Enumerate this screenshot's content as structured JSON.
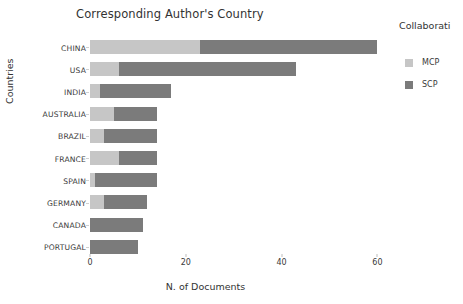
{
  "chart_data": {
    "type": "bar",
    "subtype": "horizontal-stacked-bar",
    "title": "Corresponding Author's Country",
    "xlabel": "N. of Documents",
    "ylabel": "Countries",
    "xlim": [
      0,
      62
    ],
    "xticks": [
      0,
      20,
      40,
      60
    ],
    "xtick_labels": [
      "0",
      "20",
      "40",
      "60"
    ],
    "grid": false,
    "legend_position": "right",
    "legend_title": "Collaborati",
    "categories": [
      "CHINA",
      "USA",
      "INDIA",
      "AUSTRALIA",
      "BRAZIL",
      "FRANCE",
      "SPAIN",
      "GERMANY",
      "CANADA",
      "PORTUGAL"
    ],
    "series": [
      {
        "name": "MCP",
        "color": "#c6c6c6",
        "values": [
          23,
          6,
          2,
          5,
          3,
          6,
          1,
          3,
          0,
          0
        ]
      },
      {
        "name": "SCP",
        "color": "#7b7b7b",
        "values": [
          37,
          37,
          15,
          9,
          11,
          8,
          13,
          9,
          11,
          10
        ]
      }
    ],
    "totals": [
      60,
      43,
      17,
      14,
      14,
      14,
      14,
      12,
      11,
      10
    ]
  },
  "legend": {
    "title": "Collaborati",
    "items": [
      {
        "label": "MCP",
        "color": "#c6c6c6"
      },
      {
        "label": "SCP",
        "color": "#7b7b7b"
      }
    ]
  }
}
